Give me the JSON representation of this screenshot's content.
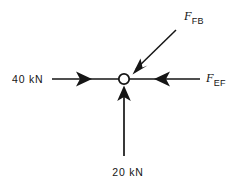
{
  "figure": {
    "background_color": "#ffffff",
    "stroke_color": "#151515",
    "node": {
      "label": "joint-node",
      "cx": 124,
      "cy": 79,
      "r": 5.2,
      "fill": "#ffffff"
    },
    "forces": [
      {
        "id": "force-left",
        "label": "40 kN",
        "symbol": "",
        "subscript": "",
        "magnitude": 40,
        "unit": "kN",
        "direction": "right",
        "label_x": 12,
        "label_y": 83,
        "line": {
          "x1": 52,
          "y1": 79,
          "x2": 119,
          "y2": 79
        },
        "arrow_at": {
          "x": 90,
          "y": 79
        }
      },
      {
        "id": "force-right",
        "label": "F_EF",
        "symbol": "F",
        "subscript": "EF",
        "magnitude": null,
        "unit": "",
        "direction": "left",
        "label_x": 207,
        "label_y": 83,
        "line": {
          "x1": 200,
          "y1": 79,
          "x2": 130,
          "y2": 79
        },
        "arrow_at": {
          "x": 157,
          "y": 79
        }
      },
      {
        "id": "force-bottom",
        "label": "20 kN",
        "symbol": "",
        "subscript": "",
        "magnitude": 20,
        "unit": "kN",
        "direction": "up",
        "label_x": 128,
        "label_y": 176,
        "line": {
          "x1": 124,
          "y1": 155,
          "x2": 124,
          "y2": 86
        },
        "arrow_at": {
          "x": 124,
          "y": 95
        }
      },
      {
        "id": "force-diagonal",
        "label": "F_FB",
        "symbol": "F",
        "subscript": "FB",
        "magnitude": null,
        "unit": "",
        "direction": "down-left",
        "label_x": 185,
        "label_y": 20,
        "line": {
          "x1": 175,
          "y1": 31,
          "x2": 133,
          "y2": 72
        },
        "arrow_at": {
          "x": 136,
          "y": 69
        }
      }
    ]
  }
}
